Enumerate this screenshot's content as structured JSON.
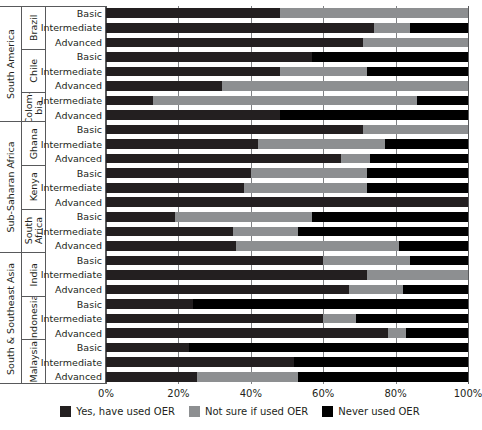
{
  "chart_data": {
    "type": "bar",
    "orientation": "horizontal",
    "stacked": true,
    "stack_mode": "percent",
    "title": "",
    "xlabel": "",
    "ylabel": "",
    "xlim": [
      0,
      100
    ],
    "xticks": [
      "0%",
      "20%",
      "40%",
      "60%",
      "80%",
      "100%"
    ],
    "xtick_values": [
      0,
      20,
      40,
      60,
      80,
      100
    ],
    "grid": true,
    "legend_position": "bottom",
    "series": [
      {
        "name": "Yes, have used OER",
        "key": "yes",
        "color": "#231f20"
      },
      {
        "name": "Not sure if used OER",
        "key": "notsure",
        "color": "#8d8f91"
      },
      {
        "name": "Never used OER",
        "key": "never",
        "color": "#000000"
      }
    ],
    "categories": [
      "Basic",
      "Intermediate",
      "Advanced"
    ],
    "regions": [
      {
        "region": "South America",
        "countries": [
          {
            "country": "Brazil",
            "rows": [
              {
                "level": "Basic",
                "yes": 48,
                "notsure": 52,
                "never": 0
              },
              {
                "level": "Intermediate",
                "yes": 74,
                "notsure": 10,
                "never": 16
              },
              {
                "level": "Advanced",
                "yes": 71,
                "notsure": 29,
                "never": 0
              }
            ]
          },
          {
            "country": "Chile",
            "rows": [
              {
                "level": "Basic",
                "yes": 57,
                "notsure": 0,
                "never": 43
              },
              {
                "level": "Intermediate",
                "yes": 48,
                "notsure": 24,
                "never": 28
              },
              {
                "level": "Advanced",
                "yes": 32,
                "notsure": 68,
                "never": 0
              }
            ]
          },
          {
            "country": "Colom-\nbia",
            "rows": [
              {
                "level": "Intermediate",
                "yes": 13,
                "notsure": 73,
                "never": 14
              },
              {
                "level": "Advanced",
                "yes": 48,
                "notsure": 0,
                "never": 52
              }
            ]
          }
        ]
      },
      {
        "region": "Sub-Saharan Africa",
        "countries": [
          {
            "country": "Ghana",
            "rows": [
              {
                "level": "Basic",
                "yes": 71,
                "notsure": 29,
                "never": 0
              },
              {
                "level": "Intermediate",
                "yes": 42,
                "notsure": 35,
                "never": 23
              },
              {
                "level": "Advanced",
                "yes": 65,
                "notsure": 8,
                "never": 27
              }
            ]
          },
          {
            "country": "Kenya",
            "rows": [
              {
                "level": "Basic",
                "yes": 40,
                "notsure": 32,
                "never": 28
              },
              {
                "level": "Intermediate",
                "yes": 38,
                "notsure": 34,
                "never": 28
              },
              {
                "level": "Advanced",
                "yes": 100,
                "notsure": 0,
                "never": 0
              }
            ]
          },
          {
            "country": "South\nAfrica",
            "rows": [
              {
                "level": "Basic",
                "yes": 19,
                "notsure": 38,
                "never": 43
              },
              {
                "level": "Intermediate",
                "yes": 35,
                "notsure": 18,
                "never": 47
              },
              {
                "level": "Advanced",
                "yes": 36,
                "notsure": 45,
                "never": 19
              }
            ]
          }
        ]
      },
      {
        "region": "South & Southeast Asia",
        "countries": [
          {
            "country": "India",
            "rows": [
              {
                "level": "Basic",
                "yes": 60,
                "notsure": 24,
                "never": 16
              },
              {
                "level": "Intermediate",
                "yes": 72,
                "notsure": 28,
                "never": 0
              },
              {
                "level": "Advanced",
                "yes": 67,
                "notsure": 15,
                "never": 18
              }
            ]
          },
          {
            "country": "Indonesia",
            "rows": [
              {
                "level": "Basic",
                "yes": 24,
                "notsure": 0,
                "never": 76
              },
              {
                "level": "Intermediate",
                "yes": 60,
                "notsure": 9,
                "never": 31
              },
              {
                "level": "Advanced",
                "yes": 78,
                "notsure": 5,
                "never": 17
              }
            ]
          },
          {
            "country": "Malaysia",
            "rows": [
              {
                "level": "Basic",
                "yes": 23,
                "notsure": 0,
                "never": 77
              },
              {
                "level": "Intermediate",
                "yes": 52,
                "notsure": 0,
                "never": 48
              },
              {
                "level": "Advanced",
                "yes": 25,
                "notsure": 28,
                "never": 47
              }
            ]
          }
        ]
      }
    ]
  },
  "legend": {
    "items": [
      {
        "label": "Yes, have used OER",
        "key": "yes"
      },
      {
        "label": "Not sure if used OER",
        "key": "notsure"
      },
      {
        "label": "Never used OER",
        "key": "never"
      }
    ]
  },
  "colors": {
    "yes": "#231f20",
    "notsure": "#8d8f91",
    "never": "#000000",
    "gridline": "#808285",
    "frame": "#58595b",
    "text": "#231f20",
    "background": "#ffffff"
  }
}
